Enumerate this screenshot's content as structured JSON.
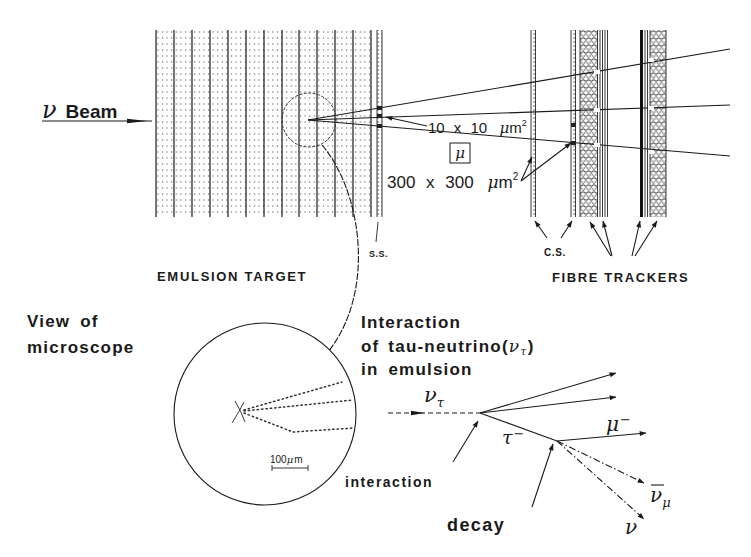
{
  "top": {
    "beam": {
      "nu": "ν",
      "text": "Beam"
    },
    "track_resolution": {
      "value": "10 x 10",
      "mu": "μ",
      "m": "m",
      "exp": "2"
    },
    "muon_box": "μ",
    "fibre_resolution": {
      "value": "300 x 300",
      "mu": "μ",
      "m": "m",
      "exp": "2"
    },
    "labels": {
      "emulsion_target": "EMULSION TARGET",
      "ss": "S.S.",
      "cs": "C.S.",
      "fibre_trackers": "FIBRE TRACKERS"
    }
  },
  "microscope": {
    "title_lines": [
      "View of",
      "microscope"
    ],
    "scale_bar": {
      "value": "100",
      "mu": "μ",
      "m": "m"
    }
  },
  "interaction": {
    "title_lines": [
      "Interaction",
      "of tau-neutrino(",
      "in emulsion"
    ],
    "title_nu": "ν",
    "title_nu_sub": "τ",
    "title_close": ")",
    "particles": {
      "nu_tau": {
        "symbol": "ν",
        "sub": "τ"
      },
      "tau": {
        "symbol": "τ",
        "sup": "−"
      },
      "muon": {
        "symbol": "μ",
        "sup": "−"
      },
      "anti_nu_mu": {
        "symbol": "ν",
        "sub": "μ"
      },
      "nu": {
        "symbol": "ν"
      }
    },
    "pointers": {
      "interaction": "interaction",
      "decay": "decay"
    }
  }
}
